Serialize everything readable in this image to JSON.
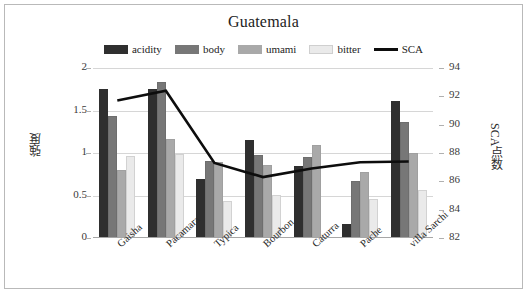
{
  "chart_data": {
    "type": "bar",
    "title": "Guatemala",
    "xlabel": "",
    "ylabel": "強度",
    "y2label": "SCA点数",
    "categories": [
      "Gaisha",
      "Pacamara",
      "Typica",
      "Bourbon",
      "Caturra",
      "Pache",
      "villa Sarchi"
    ],
    "series": [
      {
        "name": "acidity",
        "type": "bar",
        "color": "#2f2f2f",
        "axis": "left",
        "values": [
          1.75,
          1.75,
          0.7,
          1.15,
          0.85,
          0.16,
          1.61
        ]
      },
      {
        "name": "body",
        "type": "bar",
        "color": "#777777",
        "axis": "left",
        "values": [
          1.44,
          1.83,
          0.91,
          0.98,
          0.95,
          0.67,
          1.36
        ]
      },
      {
        "name": "umami",
        "type": "bar",
        "color": "#a9a9a9",
        "axis": "left",
        "values": [
          0.8,
          1.16,
          0.89,
          0.86,
          1.1,
          0.78,
          1.0
        ]
      },
      {
        "name": "bitter",
        "type": "bar",
        "color": "#eaeaea",
        "axis": "left",
        "values": [
          0.96,
          0.99,
          0.44,
          0.51,
          0.0,
          0.46,
          0.56
        ]
      },
      {
        "name": "SCA",
        "type": "line",
        "color": "#0d0d0d",
        "axis": "right",
        "values": [
          91.7,
          92.4,
          87.3,
          86.3,
          86.9,
          87.35,
          87.4
        ]
      }
    ],
    "ylim": [
      0,
      2
    ],
    "yticks": [
      0,
      0.5,
      1,
      1.5,
      2
    ],
    "ytick_labels": [
      "0",
      "0.5",
      "1",
      "1.5",
      "2"
    ],
    "y2lim": [
      82,
      94
    ],
    "y2ticks": [
      82,
      84,
      86,
      88,
      90,
      92,
      94
    ],
    "y2tick_labels": [
      "82",
      "84",
      "86",
      "88",
      "90",
      "92",
      "94"
    ],
    "grid": true,
    "legend_position": "top",
    "legend": [
      "acidity",
      "body",
      "umami",
      "bitter",
      "SCA"
    ]
  }
}
